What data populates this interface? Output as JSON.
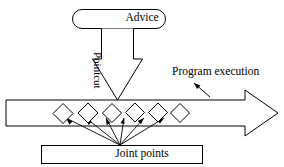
{
  "diagram": {
    "type": "flow-diagram",
    "colors": {
      "stroke": "#000000",
      "fill": "#ffffff",
      "background": "#ffffff"
    },
    "nodes": {
      "advice": {
        "label": "Advice",
        "shape": "rounded-rectangle"
      },
      "joint_points": {
        "label": "Joint points",
        "shape": "rectangle"
      },
      "program_execution": {
        "label": "Program execution",
        "shape": "block-arrow-right"
      },
      "pointcut": {
        "label": "Pointcut",
        "shape": "block-arrow-down",
        "rotation_deg": 90
      }
    },
    "joinpoint_markers": {
      "shape": "diamond",
      "count": 6,
      "label": ""
    }
  }
}
